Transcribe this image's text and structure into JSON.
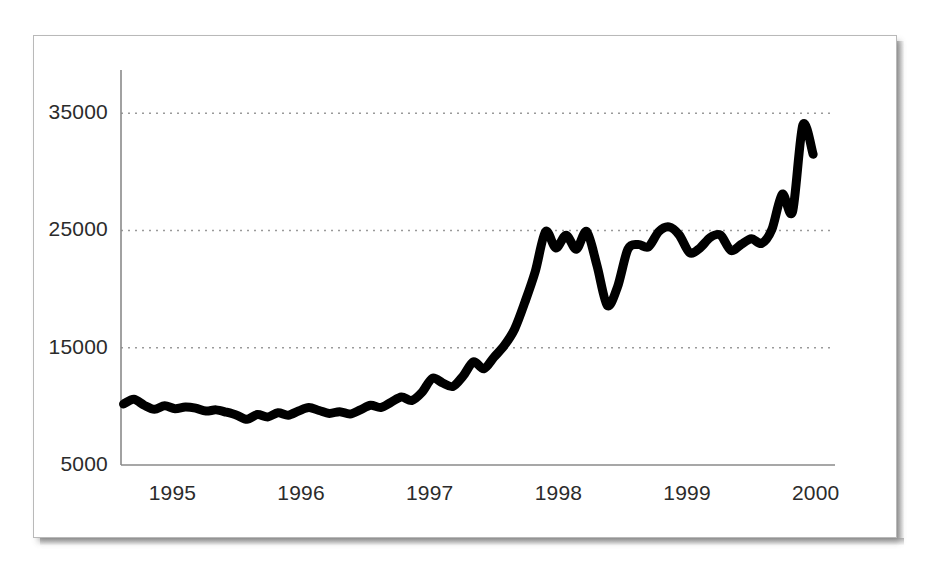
{
  "figure": {
    "background_color": "#ffffff",
    "card_border_color": "#b9b9b9",
    "line_color": "#000000",
    "grid_color": "#9a9a9a",
    "axis_color": "#8a8a8a",
    "label_color": "#2b2b2b"
  },
  "chart_data": {
    "type": "line",
    "title": "",
    "xlabel": "",
    "ylabel": "",
    "grid": true,
    "grid_style": "dotted-horizontal",
    "legend": "none",
    "xlim": [
      1994.6,
      2000.15
    ],
    "ylim": [
      5000,
      38000
    ],
    "xticks": [
      1995,
      1996,
      1997,
      1998,
      1999,
      2000
    ],
    "xtick_labels": [
      "1995",
      "1996",
      "1997",
      "1998",
      "1999",
      "2000"
    ],
    "yticks": [
      5000,
      15000,
      25000,
      35000
    ],
    "ytick_labels": [
      "5000",
      "15000",
      "25000",
      "35000"
    ],
    "gridline_values": [
      15000,
      25000,
      35000
    ],
    "series": [
      {
        "name": "index",
        "color": "#000000",
        "line_width": 9,
        "x": [
          1994.62,
          1994.7,
          1994.78,
          1994.86,
          1994.94,
          1995.02,
          1995.1,
          1995.18,
          1995.26,
          1995.34,
          1995.42,
          1995.5,
          1995.58,
          1995.66,
          1995.74,
          1995.82,
          1995.9,
          1995.98,
          1996.06,
          1996.14,
          1996.22,
          1996.3,
          1996.38,
          1996.46,
          1996.54,
          1996.62,
          1996.7,
          1996.78,
          1996.86,
          1996.94,
          1997.02,
          1997.1,
          1997.18,
          1997.26,
          1997.34,
          1997.42,
          1997.5,
          1997.58,
          1997.66,
          1997.74,
          1997.82,
          1997.9,
          1997.98,
          1998.06,
          1998.14,
          1998.22,
          1998.3,
          1998.38,
          1998.46,
          1998.54,
          1998.62,
          1998.7,
          1998.78,
          1998.86,
          1998.94,
          1999.02,
          1999.1,
          1999.18,
          1999.26,
          1999.34,
          1999.42,
          1999.5,
          1999.58,
          1999.66,
          1999.74,
          1999.82,
          1999.9,
          1999.98
        ],
        "y": [
          10200,
          10600,
          10100,
          9750,
          10050,
          9800,
          9950,
          9850,
          9600,
          9700,
          9500,
          9250,
          8900,
          9300,
          9100,
          9450,
          9250,
          9600,
          9900,
          9650,
          9400,
          9550,
          9350,
          9700,
          10100,
          9900,
          10350,
          10800,
          10500,
          11200,
          12400,
          12000,
          11700,
          12600,
          13800,
          13200,
          14200,
          15200,
          16600,
          18900,
          21500,
          24900,
          23500,
          24600,
          23400,
          24900,
          22000,
          18600,
          20200,
          23400,
          23800,
          23600,
          24900,
          25300,
          24600,
          23100,
          23500,
          24400,
          24600,
          23300,
          23800,
          24300,
          23900,
          25100,
          28100,
          26600,
          34000,
          31500
        ]
      }
    ],
    "annotations": {
      "peak_value": 34000,
      "peak_x": 1999.9,
      "trough_1998_value": 18600,
      "trough_1998_x": 1998.38,
      "start_value": 10200,
      "end_value": 31500
    }
  }
}
